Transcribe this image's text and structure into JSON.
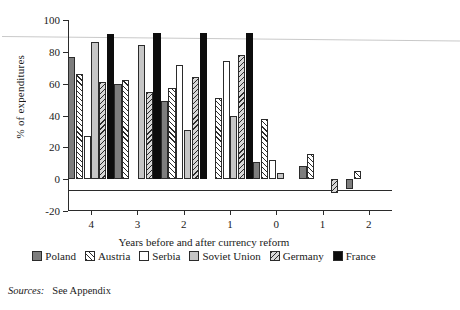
{
  "chart_data": {
    "type": "bar",
    "title": "",
    "xlabel": "Years before and after currency reform",
    "ylabel": "% of expenditures",
    "categories": [
      "4",
      "3",
      "2",
      "1",
      "0",
      "1",
      "2"
    ],
    "ylim": [
      -20,
      100
    ],
    "yticks": [
      -20,
      0,
      20,
      40,
      60,
      80,
      100
    ],
    "grid": false,
    "legend_position": "bottom",
    "series": [
      {
        "name": "Poland",
        "color": "#7d7d7d",
        "pattern": "solid-gray",
        "values": [
          77,
          60,
          49,
          null,
          11,
          8,
          -6
        ]
      },
      {
        "name": "Austria",
        "color": "#ffffff",
        "pattern": "forward-hatch",
        "values": [
          66,
          62,
          57,
          51,
          38,
          16,
          5
        ]
      },
      {
        "name": "Serbia",
        "color": "#ffffff",
        "pattern": "empty",
        "values": [
          27,
          null,
          72,
          74,
          12,
          null,
          null
        ]
      },
      {
        "name": "Soviet Union",
        "color": "#c6c6c6",
        "pattern": "light-gray",
        "values": [
          86,
          84,
          31,
          40,
          4,
          null,
          null
        ]
      },
      {
        "name": "Germany",
        "color": "#d8d8d8",
        "pattern": "back-hatch",
        "values": [
          61,
          55,
          64,
          78,
          null,
          -9,
          null
        ]
      },
      {
        "name": "France",
        "color": "#0d0d0d",
        "pattern": "solid-black",
        "values": [
          91,
          92,
          92,
          92,
          null,
          null,
          null
        ]
      }
    ]
  },
  "axis": {
    "y_title": "% of expenditures",
    "y_labels": [
      "100",
      "80",
      "60",
      "40",
      "20",
      "0",
      "-20"
    ],
    "x_title": "Years before and after currency reform",
    "x_labels": [
      "4",
      "3",
      "2",
      "1",
      "0",
      "1",
      "2"
    ]
  },
  "legend": {
    "items": [
      {
        "label": "Poland"
      },
      {
        "label": "Austria"
      },
      {
        "label": "Serbia"
      },
      {
        "label": "Soviet Union"
      },
      {
        "label": "Germany"
      },
      {
        "label": "France"
      }
    ]
  },
  "source": {
    "label": "Sources:",
    "text": "See Appendix"
  }
}
